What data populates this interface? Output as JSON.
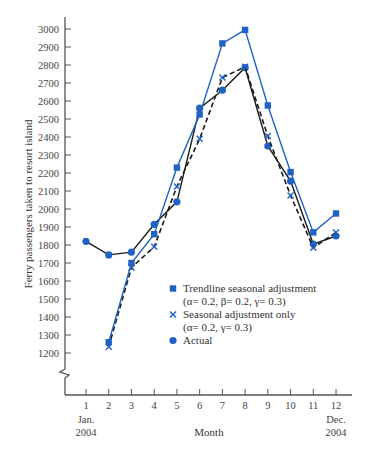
{
  "chart_data": {
    "type": "line",
    "title": "",
    "xlabel": "Month",
    "ylabel": "Ferry passengers taken to resort island",
    "x": [
      1,
      2,
      3,
      4,
      5,
      6,
      7,
      8,
      9,
      10,
      11,
      12
    ],
    "x_tick_labels": [
      "1",
      "2",
      "3",
      "4",
      "5",
      "6",
      "7",
      "8",
      "9",
      "10",
      "11",
      "12"
    ],
    "x_sublabels": {
      "start": [
        "Jan.",
        "2004"
      ],
      "end": [
        "Dec.",
        "2004"
      ]
    },
    "y_ticks": [
      1200,
      1300,
      1400,
      1500,
      1600,
      1700,
      1800,
      1900,
      2000,
      2100,
      2200,
      2300,
      2400,
      2500,
      2600,
      2700,
      2800,
      2900,
      3000
    ],
    "ylim": [
      1200,
      3000
    ],
    "axis_break": true,
    "grid": false,
    "legend_position": "inside-lower-right",
    "series": [
      {
        "name": "Trendline seasonal adjustment",
        "params": "(α= 0.2, β= 0.2, γ= 0.3)",
        "marker": "square",
        "line_style": "solid",
        "color": "#1f62c4",
        "values": [
          null,
          1260,
          1700,
          1860,
          2230,
          2525,
          2920,
          2995,
          2575,
          2205,
          1870,
          1975
        ]
      },
      {
        "name": "Seasonal adjustment only",
        "params": "(α= 0.2, γ= 0.3)",
        "marker": "x",
        "line_style": "dashed",
        "color": "#1a1a1a",
        "marker_color": "#1f62c4",
        "values": [
          null,
          1235,
          1675,
          1790,
          2125,
          2390,
          2730,
          2790,
          2405,
          2075,
          1785,
          1870
        ]
      },
      {
        "name": "Actual",
        "params": "",
        "marker": "circle",
        "line_style": "solid",
        "color": "#1a1a1a",
        "marker_color": "#1f62c4",
        "values": [
          1820,
          1745,
          1760,
          1915,
          2040,
          2560,
          2660,
          2785,
          2350,
          2155,
          1805,
          1850
        ]
      }
    ]
  }
}
